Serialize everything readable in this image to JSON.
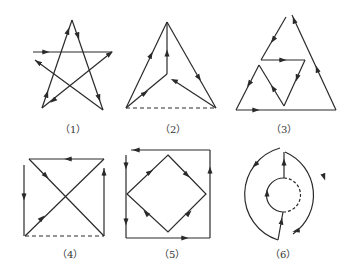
{
  "figures": [
    {
      "id": 1,
      "label": "（1）",
      "shape": "five-pointed star drawn in one continuous directed stroke"
    },
    {
      "id": 2,
      "label": "（2）",
      "shape": "triangle with internal Y junction, dashed base"
    },
    {
      "id": 3,
      "label": "（3）",
      "shape": "large triangle with nested inner zigzag triangle"
    },
    {
      "id": 4,
      "label": "（4）",
      "shape": "square with both diagonals, dashed bottom edge"
    },
    {
      "id": 5,
      "label": "（5）",
      "shape": "square with inscribed diamond"
    },
    {
      "id": 6,
      "label": "（6）",
      "shape": "broken outer circle with inner dashed circle"
    }
  ],
  "colors": {
    "stroke": "#2a2a2a",
    "background": "#ffffff"
  }
}
